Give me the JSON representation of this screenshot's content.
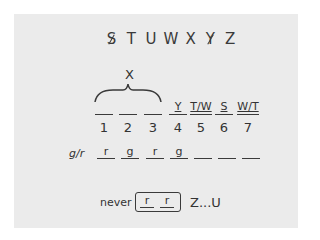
{
  "top_sequence": {
    "letters": [
      {
        "char": "S",
        "struck": true
      },
      {
        "char": "T",
        "struck": false
      },
      {
        "char": "U",
        "struck": false
      },
      {
        "char": "W",
        "struck": false
      },
      {
        "char": "X",
        "struck": false
      },
      {
        "char": "Y",
        "struck": true
      },
      {
        "char": "Z",
        "struck": false
      }
    ]
  },
  "brace_label": "X",
  "slots": [
    {
      "position": "1",
      "label": ""
    },
    {
      "position": "2",
      "label": ""
    },
    {
      "position": "3",
      "label": ""
    },
    {
      "position": "4",
      "label": "Y"
    },
    {
      "position": "5",
      "label": "T/W"
    },
    {
      "position": "6",
      "label": "S"
    },
    {
      "position": "7",
      "label": "W/T"
    }
  ],
  "gr_row": {
    "label": "g/r",
    "values": [
      "r",
      "g",
      "r",
      "g",
      "",
      "",
      ""
    ]
  },
  "rule": {
    "prefix": "never",
    "boxed": [
      "r",
      "r"
    ],
    "suffix": "Z...U"
  }
}
